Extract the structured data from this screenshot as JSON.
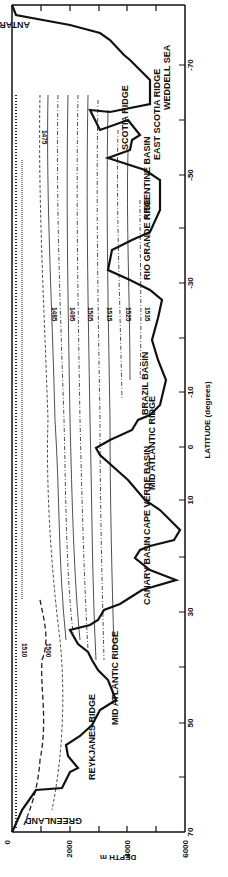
{
  "figure": {
    "type": "oceanographic-section",
    "orientation": "rotated-90",
    "x_axis": {
      "label": "DEPTH m",
      "ticks": [
        "0",
        "2000",
        "4000",
        "6000"
      ]
    },
    "y_axis": {
      "label": "LATITUDE (degrees)",
      "ticks": [
        "70",
        "50",
        "30",
        "10",
        "0",
        "-10",
        "-30",
        "-50",
        "-70"
      ]
    },
    "features": [
      "GREENLAND",
      "REYKJANES RIDGE",
      "MID ATLANTIC RIDGE",
      "CANARY BASIN",
      "CAPE VERDE BASIN",
      "MID ATLANTIC RIDGE",
      "BRAZIL BASIN",
      "RIO GRANDE RISE",
      "ARGENTINE BASIN",
      "EAST SCOTIA RIDGE",
      "SCOTIA RIDGE",
      "WEDDELL SEA",
      "ANTARCTICA"
    ],
    "contour_labels": [
      "1475",
      "1485",
      "1495",
      "1505",
      "1515",
      "1525",
      "1535",
      "1500",
      "1510"
    ]
  }
}
